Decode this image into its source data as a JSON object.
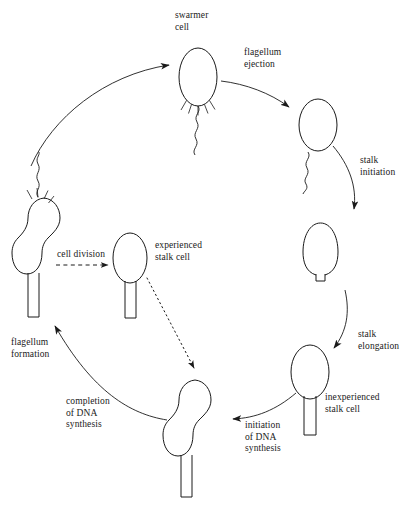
{
  "diagram": {
    "type": "cycle-diagram",
    "background_color": "#ffffff",
    "stroke_color": "#1a1a1a",
    "text_color": "#1a1a1a"
  },
  "labels": {
    "swarmer_cell": "swarmer\ncell",
    "flagellum_ejection": "flagellum\nejection",
    "stalk_initiation": "stalk\ninitiation",
    "stalk_elongation": "stalk\nelongation",
    "inexperienced_stalk_cell": "inexperienced\nstalk cell",
    "initiation_of_dna_synthesis": "initiation\nof DNA\nsynthesis",
    "completion_of_dna_synthesis": "completion\nof DNA\nsynthesis",
    "flagellum_formation": "flagellum\nformation",
    "cell_division": "cell division",
    "experienced_stalk_cell": "experienced\nstalk cell"
  },
  "stages": [
    {
      "id": "swarmer-cell",
      "name": "swarmer cell",
      "features": "oval body, polar flagellum, polar pili",
      "position": "top"
    },
    {
      "id": "flagellum-ejected-cell",
      "name": "cell after flagellum ejection",
      "features": "oval body, detached free flagellum nearby",
      "position": "upper-right"
    },
    {
      "id": "stalk-initiation-cell",
      "name": "cell with nascent stalk",
      "features": "oval body, short stalk stub",
      "position": "right"
    },
    {
      "id": "inexperienced-stalk-cell",
      "name": "inexperienced stalk cell",
      "features": "oval body, long stalk",
      "position": "lower-right"
    },
    {
      "id": "predivisional-cell",
      "name": "predivisional cell (DNA synthesis)",
      "features": "dumbbell body, long stalk",
      "position": "bottom"
    },
    {
      "id": "flagellated-predivisional-cell",
      "name": "predivisional cell with flagellum",
      "features": "dumbbell body, long stalk, flagellum and pili at free pole",
      "position": "left"
    },
    {
      "id": "experienced-stalk-cell",
      "name": "experienced stalk cell",
      "features": "oval body, long stalk",
      "position": "center"
    }
  ],
  "transitions": [
    {
      "from": "swarmer-cell",
      "to": "flagellum-ejected-cell",
      "label": "flagellum ejection",
      "style": "solid"
    },
    {
      "from": "flagellum-ejected-cell",
      "to": "stalk-initiation-cell",
      "label": "stalk initiation",
      "style": "solid"
    },
    {
      "from": "stalk-initiation-cell",
      "to": "inexperienced-stalk-cell",
      "label": "stalk elongation",
      "style": "solid"
    },
    {
      "from": "inexperienced-stalk-cell",
      "to": "predivisional-cell",
      "label": "initiation of DNA synthesis",
      "style": "solid"
    },
    {
      "from": "predivisional-cell",
      "to": "flagellated-predivisional-cell",
      "label": "completion of DNA synthesis",
      "style": "solid"
    },
    {
      "from": "flagellated-predivisional-cell",
      "to": "swarmer-cell",
      "label": "flagellum formation",
      "style": "solid"
    },
    {
      "from": "flagellated-predivisional-cell",
      "to": "experienced-stalk-cell",
      "label": "cell division",
      "style": "dashed"
    },
    {
      "from": "experienced-stalk-cell",
      "to": "predivisional-cell",
      "label": "",
      "style": "dotted"
    }
  ]
}
